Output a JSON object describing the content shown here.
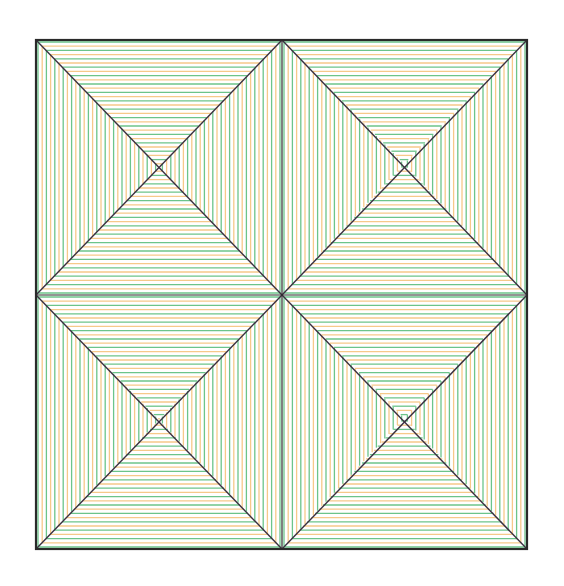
{
  "figure": {
    "type": "geometric-pattern",
    "frame": {
      "x0": 36,
      "y0": 40,
      "x1": 527,
      "y1": 549
    },
    "divider": {
      "x": 282,
      "y": 295
    },
    "cells": [
      {
        "name": "top-left",
        "x0": 36,
        "y0": 40,
        "x1": 282,
        "y1": 295,
        "cx": 159,
        "cy": 167
      },
      {
        "name": "top-right",
        "x0": 282,
        "y0": 40,
        "x1": 527,
        "y1": 295,
        "cx": 404,
        "cy": 164
      },
      {
        "name": "bottom-left",
        "x0": 36,
        "y0": 295,
        "x1": 282,
        "y1": 549,
        "cx": 159,
        "cy": 420
      },
      {
        "name": "bottom-right",
        "x0": 282,
        "y0": 295,
        "x1": 527,
        "y1": 549,
        "cx": 404,
        "cy": 418
      }
    ],
    "line_spacing": 4.2,
    "colors": {
      "green": "#6cc48a",
      "orange": "#f6c98a",
      "frame": "#2a2a2a",
      "diagonal": "#3a3040"
    }
  }
}
